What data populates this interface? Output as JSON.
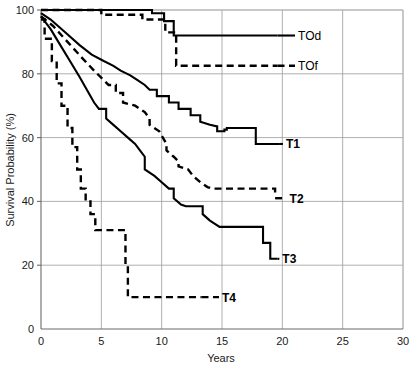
{
  "chart_data": {
    "type": "line",
    "title": "",
    "xlabel": "Years",
    "ylabel": "Survival Probability (%)",
    "xlim": [
      0,
      30
    ],
    "ylim": [
      0,
      100
    ],
    "xticks": [
      0,
      5,
      10,
      15,
      20,
      25,
      30
    ],
    "yticks": [
      0,
      20,
      40,
      60,
      80,
      100
    ],
    "xtick_labels": [
      "0",
      "5",
      "10",
      "15",
      "20",
      "25",
      "30"
    ],
    "ytick_labels": [
      "0",
      "20",
      "40",
      "60",
      "80",
      "100"
    ],
    "grid": true,
    "legend_position": "inline-right-of-curves",
    "style_note": "Kaplan-Meier step curves; solid lines and dashed lines",
    "series": [
      {
        "name": "TOd",
        "label": "TOd",
        "style": "solid",
        "color": "#000000",
        "label_x": 21.3,
        "label_y": 92.0,
        "points": [
          [
            0,
            100
          ],
          [
            9.2,
            100
          ],
          [
            9.2,
            99
          ],
          [
            10.2,
            99
          ],
          [
            10.2,
            96.5
          ],
          [
            11.0,
            96.5
          ],
          [
            11.0,
            92.0
          ],
          [
            19.6,
            92.0
          ]
        ]
      },
      {
        "name": "TOf",
        "label": "TOf",
        "style": "dashed",
        "color": "#000000",
        "label_x": 21.3,
        "label_y": 82.5,
        "points": [
          [
            0,
            100
          ],
          [
            5.0,
            100
          ],
          [
            5.0,
            98.5
          ],
          [
            8.4,
            98.5
          ],
          [
            8.4,
            97.0
          ],
          [
            10.3,
            97.0
          ],
          [
            10.3,
            93.0
          ],
          [
            11.2,
            93.0
          ],
          [
            11.2,
            82.5
          ],
          [
            19.6,
            82.5
          ]
        ]
      },
      {
        "name": "T1",
        "label": "T1",
        "style": "solid",
        "color": "#000000",
        "label_x": 20.3,
        "label_y": 58.0,
        "points": [
          [
            0,
            99
          ],
          [
            0.8,
            97
          ],
          [
            2.0,
            93
          ],
          [
            3.2,
            89
          ],
          [
            4.2,
            86
          ],
          [
            5.2,
            84
          ],
          [
            6.0,
            82.5
          ],
          [
            6.6,
            81
          ],
          [
            7.4,
            79.5
          ],
          [
            8.0,
            78
          ],
          [
            8.6,
            76.5
          ],
          [
            9.0,
            75
          ],
          [
            9.6,
            75
          ],
          [
            9.6,
            73
          ],
          [
            10.6,
            73
          ],
          [
            10.6,
            71
          ],
          [
            11.4,
            71
          ],
          [
            11.4,
            69
          ],
          [
            12.4,
            69
          ],
          [
            12.4,
            67
          ],
          [
            13.2,
            67
          ],
          [
            13.2,
            65
          ],
          [
            14.0,
            64
          ],
          [
            14.6,
            63.5
          ],
          [
            14.6,
            62
          ],
          [
            15.2,
            62
          ],
          [
            15.2,
            62.5
          ],
          [
            15.4,
            62.5
          ],
          [
            15.4,
            63
          ],
          [
            17.8,
            63
          ],
          [
            17.8,
            58
          ],
          [
            19.8,
            58
          ]
        ]
      },
      {
        "name": "T2",
        "label": "T2",
        "style": "dashed",
        "color": "#000000",
        "label_x": 20.6,
        "label_y": 41.0,
        "points": [
          [
            0,
            98
          ],
          [
            1.0,
            95
          ],
          [
            2.2,
            90
          ],
          [
            3.4,
            85
          ],
          [
            4.4,
            81
          ],
          [
            5.2,
            78
          ],
          [
            5.6,
            76.5
          ],
          [
            6.2,
            76.5
          ],
          [
            6.2,
            74
          ],
          [
            6.8,
            74
          ],
          [
            6.8,
            71
          ],
          [
            7.8,
            70
          ],
          [
            8.6,
            68
          ],
          [
            9.0,
            66
          ],
          [
            9.0,
            64
          ],
          [
            9.8,
            62
          ],
          [
            10.4,
            58
          ],
          [
            10.4,
            56
          ],
          [
            11.0,
            54
          ],
          [
            11.4,
            52.5
          ],
          [
            11.4,
            51
          ],
          [
            12.2,
            50
          ],
          [
            12.6,
            48
          ],
          [
            13.2,
            46
          ],
          [
            13.8,
            44.5
          ],
          [
            14.2,
            44
          ],
          [
            19.4,
            44
          ],
          [
            19.4,
            41.5
          ]
        ]
      },
      {
        "name": "T3",
        "label": "T3",
        "style": "solid",
        "color": "#000000",
        "label_x": 20.0,
        "label_y": 22.0,
        "points": [
          [
            0,
            98
          ],
          [
            0.8,
            94
          ],
          [
            1.6,
            89
          ],
          [
            2.4,
            84
          ],
          [
            3.2,
            79
          ],
          [
            3.8,
            75
          ],
          [
            4.4,
            71
          ],
          [
            4.8,
            69
          ],
          [
            5.4,
            69
          ],
          [
            5.4,
            66
          ],
          [
            6.0,
            64
          ],
          [
            6.6,
            62
          ],
          [
            7.2,
            60
          ],
          [
            7.8,
            58
          ],
          [
            8.2,
            56
          ],
          [
            8.6,
            54
          ],
          [
            8.6,
            50
          ],
          [
            9.4,
            48
          ],
          [
            10.0,
            46
          ],
          [
            10.6,
            44
          ],
          [
            11.0,
            44
          ],
          [
            11.0,
            41
          ],
          [
            11.6,
            39
          ],
          [
            12.0,
            38.5
          ],
          [
            13.4,
            38.5
          ],
          [
            13.4,
            36
          ],
          [
            14.0,
            34
          ],
          [
            14.8,
            32
          ],
          [
            18.4,
            32
          ],
          [
            18.4,
            27
          ],
          [
            19.0,
            27
          ],
          [
            19.0,
            22
          ],
          [
            19.6,
            22
          ]
        ]
      },
      {
        "name": "T4",
        "label": "T4",
        "style": "dashed",
        "color": "#000000",
        "label_x": 15.0,
        "label_y": 10.0,
        "points": [
          [
            0,
            97
          ],
          [
            0.3,
            97
          ],
          [
            0.3,
            91
          ],
          [
            0.9,
            91
          ],
          [
            0.9,
            84
          ],
          [
            1.3,
            84
          ],
          [
            1.3,
            77
          ],
          [
            1.7,
            77
          ],
          [
            1.7,
            70
          ],
          [
            2.2,
            70
          ],
          [
            2.2,
            63
          ],
          [
            2.6,
            63
          ],
          [
            2.6,
            57
          ],
          [
            3.0,
            57
          ],
          [
            3.0,
            50
          ],
          [
            3.3,
            50
          ],
          [
            3.3,
            44
          ],
          [
            3.7,
            44
          ],
          [
            3.7,
            40
          ],
          [
            4.1,
            40
          ],
          [
            4.1,
            36
          ],
          [
            4.5,
            36
          ],
          [
            4.5,
            31
          ],
          [
            7.0,
            31
          ],
          [
            7.0,
            20
          ],
          [
            7.2,
            20
          ],
          [
            7.2,
            10
          ],
          [
            13.3,
            10
          ]
        ]
      }
    ]
  }
}
